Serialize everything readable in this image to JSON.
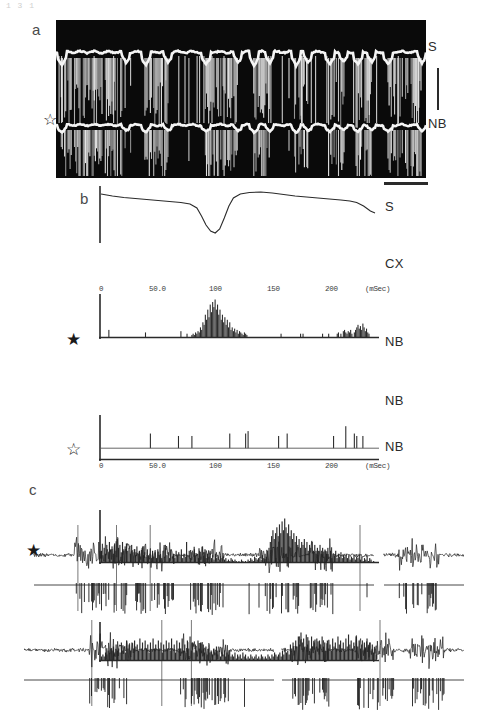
{
  "figure": {
    "top_artifact": "1 3 1",
    "panels": [
      {
        "id": "a",
        "letter": "a"
      },
      {
        "id": "b",
        "letter": "b"
      },
      {
        "id": "c",
        "letter": "c"
      }
    ]
  },
  "panel_a": {
    "letter": "a",
    "background_color": "#0a0a0a",
    "trace_color": "#f2f2f2",
    "labels": {
      "top_trace": "S",
      "bottom_trace": "NB"
    },
    "marker_open_star": "☆",
    "scale_bar_vertical": true,
    "scale_bar_horizontal": true
  },
  "panel_b": {
    "letter": "b",
    "rows": [
      {
        "name": "s-average-trace",
        "label": "S",
        "type": "line"
      },
      {
        "name": "cx-histogram",
        "label": "CX",
        "type": "histogram",
        "marker": null
      },
      {
        "name": "nb-histogram-1",
        "label": "NB",
        "type": "histogram",
        "marker": "★"
      },
      {
        "name": "nb-histogram-2",
        "label": "NB",
        "type": "histogram",
        "marker": null
      },
      {
        "name": "nb-histogram-3",
        "label": "NB",
        "type": "histogram",
        "marker": "☆"
      }
    ],
    "axis": {
      "ticks": [
        "0",
        "50.0",
        "100",
        "150",
        "200"
      ],
      "unit_label": "(mSec)",
      "xmin": 0,
      "xmax": 240
    }
  },
  "panel_c": {
    "letter": "c",
    "marker_filled_star": "★",
    "rows": [
      {
        "name": "emg-trace-row-1",
        "type": "raw"
      },
      {
        "name": "unit-raster-row-1",
        "type": "raster"
      },
      {
        "name": "emg-trace-row-2",
        "type": "raw"
      },
      {
        "name": "unit-raster-row-2",
        "type": "raster"
      }
    ]
  },
  "chart_data": {
    "type": "line",
    "title": "",
    "panels": [
      {
        "id": "b-S",
        "type": "line",
        "label": "S",
        "xlabel": "(mSec)",
        "ylabel": "",
        "xlim": [
          0,
          240
        ],
        "x": [
          0,
          10,
          20,
          30,
          40,
          50,
          60,
          70,
          78,
          84,
          88,
          92,
          96,
          100,
          104,
          108,
          112,
          116,
          122,
          130,
          140,
          150,
          160,
          170,
          180,
          190,
          200,
          210,
          218,
          224,
          230,
          236,
          240
        ],
        "y": [
          96,
          92,
          89,
          87,
          85,
          83,
          81,
          79,
          76,
          68,
          52,
          34,
          22,
          18,
          26,
          48,
          72,
          88,
          96,
          99,
          100,
          98,
          95,
          92,
          90,
          88,
          86,
          84,
          82,
          79,
          72,
          62,
          58
        ]
      },
      {
        "id": "b-CX",
        "type": "histogram",
        "label": "CX",
        "xlabel": "(mSec)",
        "ylabel": "counts",
        "xlim": [
          0,
          240
        ],
        "ylim": [
          0,
          30
        ],
        "bin_width": 1.2,
        "values": [
          0,
          0,
          0,
          0,
          0,
          0,
          6,
          0,
          0,
          0,
          0,
          0,
          0,
          0,
          0,
          0,
          0,
          0,
          0,
          0,
          0,
          0,
          0,
          0,
          0,
          0,
          0,
          0,
          0,
          0,
          0,
          0,
          0,
          0,
          0,
          0,
          4,
          0,
          0,
          0,
          0,
          0,
          0,
          0,
          0,
          0,
          0,
          0,
          0,
          0,
          0,
          0,
          0,
          0,
          0,
          0,
          0,
          0,
          0,
          0,
          0,
          0,
          0,
          0,
          0,
          5,
          0,
          0,
          0,
          0,
          3,
          0,
          0,
          0,
          2,
          3,
          2,
          4,
          3,
          5,
          4,
          8,
          6,
          12,
          10,
          18,
          14,
          22,
          16,
          26,
          20,
          28,
          24,
          30,
          22,
          26,
          18,
          22,
          14,
          18,
          12,
          16,
          10,
          14,
          8,
          12,
          6,
          8,
          5,
          7,
          4,
          6,
          3,
          5,
          4,
          3,
          2,
          4,
          3,
          2,
          0,
          0,
          0,
          0,
          0,
          0,
          0,
          0,
          0,
          0,
          0,
          0,
          0,
          0,
          0,
          0,
          0,
          0,
          0,
          0,
          0,
          0,
          0,
          0,
          0,
          0,
          0,
          3,
          0,
          0,
          0,
          0,
          0,
          0,
          0,
          0,
          0,
          0,
          0,
          0,
          0,
          0,
          0,
          3,
          0,
          3,
          0,
          0,
          0,
          0,
          0,
          0,
          0,
          0,
          0,
          0,
          0,
          0,
          0,
          0,
          0,
          3,
          0,
          0,
          0,
          0,
          3,
          0,
          0,
          0,
          0,
          0,
          0,
          3,
          4,
          0,
          3,
          0,
          5,
          6,
          4,
          3,
          5,
          4,
          6,
          3,
          0,
          4,
          6,
          8,
          10,
          7,
          9,
          6,
          11,
          8,
          5,
          7,
          4,
          3,
          0,
          0,
          0,
          0,
          0,
          0
        ]
      },
      {
        "id": "b-NB-1",
        "type": "histogram",
        "label": "NB",
        "marker": "filled-star",
        "xlim": [
          0,
          240
        ],
        "ylim": [
          0,
          10
        ],
        "bin_width": 1.2,
        "values": [
          0,
          0,
          0,
          0,
          0,
          0,
          0,
          0,
          0,
          0,
          0,
          0,
          0,
          0,
          0,
          0,
          0,
          0,
          0,
          0,
          0,
          0,
          0,
          0,
          0,
          0,
          0,
          0,
          0,
          0,
          0,
          0,
          0,
          0,
          0,
          0,
          0,
          0,
          0,
          0,
          6,
          0,
          0,
          0,
          0,
          0,
          0,
          0,
          0,
          0,
          0,
          0,
          0,
          0,
          0,
          0,
          0,
          0,
          0,
          0,
          0,
          0,
          0,
          5,
          0,
          0,
          0,
          0,
          0,
          0,
          0,
          0,
          0,
          0,
          5,
          0,
          0,
          0,
          0,
          0,
          0,
          0,
          0,
          0,
          0,
          0,
          0,
          0,
          0,
          0,
          0,
          0,
          0,
          0,
          0,
          0,
          0,
          0,
          0,
          0,
          0,
          0,
          0,
          0,
          0,
          6,
          0,
          0,
          0,
          0,
          0,
          0,
          0,
          0,
          0,
          0,
          0,
          0,
          6,
          0,
          7,
          0,
          0,
          0,
          0,
          0,
          0,
          0,
          0,
          0,
          0,
          0,
          0,
          0,
          0,
          0,
          0,
          0,
          0,
          0,
          0,
          0,
          0,
          0,
          0,
          5,
          0,
          0,
          0,
          0,
          0,
          0,
          6,
          0,
          0,
          0,
          0,
          0,
          0,
          0,
          0,
          0,
          0,
          0,
          0,
          0,
          0,
          0,
          0,
          0,
          0,
          0,
          0,
          0,
          0,
          0,
          0,
          0,
          0,
          0,
          0,
          0,
          0,
          0,
          0,
          0,
          0,
          0,
          0,
          0,
          5,
          0,
          0,
          0,
          0,
          0,
          0,
          0,
          0,
          0,
          9,
          0,
          0,
          0,
          0,
          0,
          0,
          6,
          0,
          5,
          0,
          0,
          0,
          0,
          5,
          0,
          0,
          0,
          0,
          0,
          0,
          0,
          0,
          0,
          0,
          0
        ]
      },
      {
        "id": "b-NB-2",
        "type": "histogram",
        "label": "NB",
        "xlim": [
          0,
          240
        ],
        "ylim": [
          0,
          30
        ],
        "bin_width": 1.2,
        "values": [
          8,
          5,
          10,
          6,
          12,
          7,
          14,
          9,
          11,
          6,
          13,
          8,
          16,
          10,
          12,
          7,
          14,
          9,
          11,
          13,
          8,
          10,
          6,
          12,
          7,
          9,
          5,
          11,
          6,
          8,
          4,
          10,
          5,
          7,
          4,
          9,
          5,
          6,
          3,
          8,
          4,
          7,
          3,
          9,
          5,
          6,
          3,
          8,
          4,
          10,
          5,
          7,
          3,
          9,
          4,
          6,
          3,
          8,
          5,
          7,
          4,
          9,
          3,
          6,
          4,
          14,
          5,
          8,
          3,
          7,
          4,
          9,
          5,
          6,
          3,
          8,
          4,
          11,
          5,
          7,
          3,
          6,
          4,
          8,
          3,
          5,
          2,
          6,
          3,
          4,
          2,
          5,
          3,
          4,
          2,
          3,
          1,
          2,
          1,
          3,
          2,
          1,
          2,
          1,
          0,
          1,
          0,
          2,
          1,
          0,
          1,
          0,
          2,
          1,
          3,
          2,
          1,
          4,
          3,
          2,
          3,
          4,
          2,
          5,
          3,
          6,
          4,
          8,
          10,
          14,
          18,
          22,
          16,
          20,
          24,
          18,
          26,
          20,
          28,
          22,
          30,
          24,
          20,
          26,
          18,
          22,
          16,
          20,
          14,
          18,
          12,
          16,
          10,
          14,
          12,
          16,
          10,
          14,
          8,
          12,
          10,
          14,
          8,
          12,
          6,
          10,
          8,
          12,
          6,
          10,
          4,
          8,
          6,
          10,
          4,
          8,
          3,
          6,
          5,
          8,
          3,
          6,
          4,
          7,
          3,
          5,
          4,
          6,
          3,
          5,
          2,
          4,
          3,
          5,
          2,
          4,
          3,
          5,
          2,
          4,
          1,
          3,
          2,
          4,
          1,
          3,
          2,
          0,
          1,
          0,
          0
        ]
      },
      {
        "id": "b-NB-3",
        "type": "histogram",
        "label": "NB",
        "marker": "open-star",
        "xlim": [
          0,
          240
        ],
        "ylim": [
          0,
          20
        ],
        "bin_width": 1.2,
        "values": [
          2,
          3,
          2,
          4,
          3,
          5,
          4,
          6,
          5,
          7,
          4,
          8,
          5,
          6,
          4,
          9,
          5,
          7,
          4,
          10,
          6,
          8,
          5,
          9,
          6,
          10,
          7,
          8,
          5,
          11,
          6,
          9,
          5,
          10,
          6,
          8,
          4,
          9,
          5,
          11,
          6,
          8,
          5,
          10,
          6,
          9,
          4,
          8,
          5,
          10,
          6,
          9,
          5,
          11,
          6,
          8,
          4,
          10,
          5,
          9,
          6,
          11,
          5,
          8,
          4,
          10,
          6,
          12,
          5,
          9,
          4,
          8,
          5,
          10,
          6,
          9,
          5,
          8,
          4,
          7,
          3,
          6,
          4,
          5,
          3,
          6,
          4,
          7,
          3,
          5,
          2,
          4,
          3,
          5,
          2,
          4,
          3,
          5,
          2,
          3,
          2,
          4,
          1,
          3,
          2,
          3,
          1,
          4,
          2,
          3,
          1,
          2,
          1,
          3,
          2,
          1,
          2,
          3,
          1,
          2,
          1,
          3,
          2,
          1,
          2,
          1,
          3,
          2,
          1,
          3,
          2,
          4,
          3,
          2,
          3,
          4,
          2,
          5,
          3,
          6,
          4,
          5,
          3,
          8,
          6,
          9,
          5,
          10,
          7,
          12,
          8,
          14,
          9,
          11,
          7,
          13,
          8,
          10,
          6,
          12,
          7,
          9,
          5,
          11,
          6,
          10,
          8,
          12,
          7,
          9,
          5,
          10,
          6,
          8,
          5,
          11,
          7,
          9,
          6,
          12,
          8,
          10,
          6,
          9,
          5,
          11,
          7,
          13,
          8,
          10,
          6,
          9,
          5,
          12,
          7,
          10,
          6,
          8,
          5,
          9,
          6,
          11,
          7,
          9,
          5,
          8,
          4,
          6,
          3
        ]
      }
    ]
  }
}
